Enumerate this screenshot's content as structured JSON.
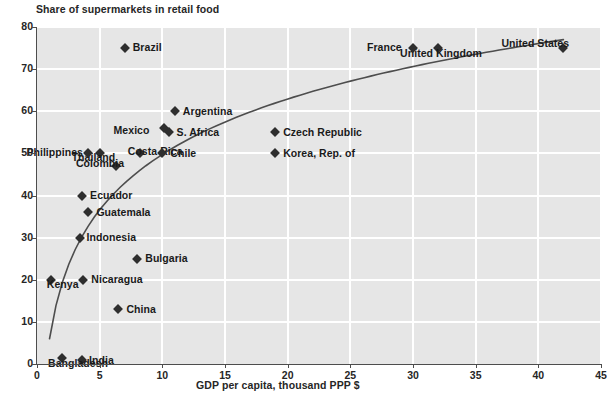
{
  "chart_data": {
    "type": "scatter",
    "title": "Share of supermarkets in retail food",
    "xlabel": "GDP per capita, thousand PPP $",
    "ylabel": "",
    "xlim": [
      0,
      45
    ],
    "ylim": [
      0,
      80
    ],
    "xticks": [
      0,
      5,
      10,
      15,
      20,
      25,
      30,
      35,
      40,
      45
    ],
    "yticks": [
      0,
      10,
      20,
      30,
      40,
      50,
      60,
      70,
      80
    ],
    "grid": true,
    "legend": "none",
    "marker_color": "#2e2e2e",
    "plot_bg_color": "#e6e6e6",
    "grid_color": "#ffffff",
    "trend_color": "#4d4d4d",
    "trend_note": "logarithmic fitted curve rising from about 6% at 1.0 to about 77% at 42",
    "points": [
      {
        "label": "Brazil",
        "x": 7.0,
        "y": 75.0,
        "label_dx": 8,
        "label_dy": -0.6
      },
      {
        "label": "United Kingdom",
        "x": 32.0,
        "y": 75.0,
        "label_dx": -38,
        "label_dy": 4.5
      },
      {
        "label": "France",
        "x": 30.0,
        "y": 75.0,
        "label_dx": -46,
        "label_dy": -0.6
      },
      {
        "label": "United States",
        "x": 42.0,
        "y": 75.0,
        "label_dx": -62,
        "label_dy": -5.0
      },
      {
        "label": "Argentina",
        "x": 11.0,
        "y": 60.0,
        "label_dx": 8,
        "label_dy": -0.6
      },
      {
        "label": "Mexico",
        "x": 10.1,
        "y": 56.0,
        "label_dx": -50,
        "label_dy": 1.6
      },
      {
        "label": "S. Africa",
        "x": 10.5,
        "y": 55.0,
        "label_dx": 8,
        "label_dy": -0.6
      },
      {
        "label": "Czech Republic",
        "x": 19.0,
        "y": 55.0,
        "label_dx": 8,
        "label_dy": -0.6
      },
      {
        "label": "Thailand",
        "x": 5.0,
        "y": 50.0,
        "label_dx": -28,
        "label_dy": 3.4
      },
      {
        "label": "Philippines",
        "x": 4.1,
        "y": 50.0,
        "label_dx": -62,
        "label_dy": -1.8
      },
      {
        "label": "Costa Rica",
        "x": 8.2,
        "y": 50.0,
        "label_dx": -12,
        "label_dy": -2.5
      },
      {
        "label": "Chile",
        "x": 10.0,
        "y": 50.0,
        "label_dx": 8,
        "label_dy": -0.6
      },
      {
        "label": "Korea, Rep. of",
        "x": 19.0,
        "y": 50.0,
        "label_dx": 8,
        "label_dy": -0.6
      },
      {
        "label": "Colombia",
        "x": 6.3,
        "y": 47.0,
        "label_dx": -40,
        "label_dy": -3.2
      },
      {
        "label": "Ecuador",
        "x": 3.6,
        "y": 40.0,
        "label_dx": 8,
        "label_dy": -0.6
      },
      {
        "label": "Guatemala",
        "x": 4.1,
        "y": 36.0,
        "label_dx": 8,
        "label_dy": -0.6
      },
      {
        "label": "Indonesia",
        "x": 3.4,
        "y": 30.0,
        "label_dx": 7,
        "label_dy": -0.6
      },
      {
        "label": "Bulgaria",
        "x": 8.0,
        "y": 25.0,
        "label_dx": 8,
        "label_dy": -0.6
      },
      {
        "label": "Nicaragua",
        "x": 3.7,
        "y": 20.0,
        "label_dx": 8,
        "label_dy": -0.6
      },
      {
        "label": "Kenya",
        "x": 1.1,
        "y": 20.0,
        "label_dx": -4,
        "label_dy": 4.0
      },
      {
        "label": "China",
        "x": 6.5,
        "y": 13.0,
        "label_dx": 8,
        "label_dy": -0.6
      },
      {
        "label": "India",
        "x": 3.6,
        "y": 1.0,
        "label_dx": 7,
        "label_dy": 0.4
      },
      {
        "label": "Bangladesh",
        "x": 2.0,
        "y": 1.5,
        "label_dx": -14,
        "label_dy": 5.2
      }
    ]
  }
}
